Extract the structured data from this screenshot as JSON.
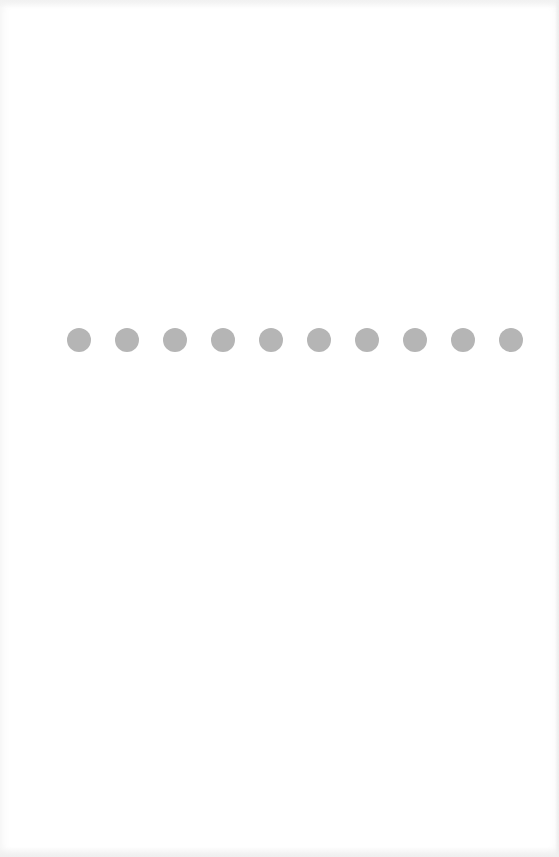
{
  "loader": {
    "dot_count": 10,
    "dot_color": "#b5b5b5",
    "dots": [
      {
        "index": 1
      },
      {
        "index": 2
      },
      {
        "index": 3
      },
      {
        "index": 4
      },
      {
        "index": 5
      },
      {
        "index": 6
      },
      {
        "index": 7
      },
      {
        "index": 8
      },
      {
        "index": 9
      },
      {
        "index": 10
      }
    ]
  },
  "colors": {
    "background": "#ffffff",
    "dot": "#b5b5b5"
  }
}
